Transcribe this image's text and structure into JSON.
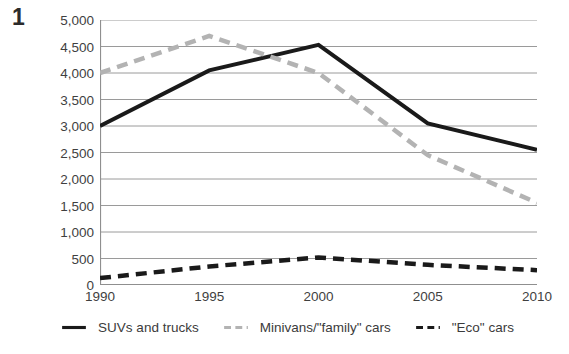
{
  "figure": {
    "number": "1"
  },
  "chart_data": {
    "type": "line",
    "title": "",
    "subtitle": "",
    "xlabel": "",
    "ylabel": "",
    "categories": [
      "1990",
      "1995",
      "2000",
      "2005",
      "2010"
    ],
    "x": [
      1990,
      1995,
      2000,
      2005,
      2010
    ],
    "xlim": [
      1990,
      2010
    ],
    "ylim": [
      0,
      5000
    ],
    "y_ticks": [
      0,
      500,
      1000,
      1500,
      2000,
      2500,
      3000,
      3500,
      4000,
      4500,
      5000
    ],
    "y_tick_labels": [
      "0",
      "500",
      "1,000",
      "1,500",
      "2,000",
      "2,500",
      "3,000",
      "3,500",
      "4,000",
      "4,500",
      "5,000"
    ],
    "x_tick_labels": [
      "1990",
      "1995",
      "2000",
      "2005",
      "2010"
    ],
    "grid": true,
    "grid_axis": "y",
    "legend_position": "bottom",
    "series": [
      {
        "name": "SUVs and trucks",
        "values": [
          3000,
          4050,
          4530,
          3050,
          2550
        ],
        "color": "#1a1a1a",
        "style": "solid",
        "width": 4
      },
      {
        "name": "Minivans/\"family\" cars",
        "values": [
          4000,
          4700,
          4000,
          2450,
          1550
        ],
        "color": "#b3b3b3",
        "style": "dashed",
        "width": 4.5
      },
      {
        "name": "\"Eco\" cars",
        "values": [
          130,
          350,
          520,
          380,
          280
        ],
        "color": "#1a1a1a",
        "style": "dashed",
        "width": 4.5
      }
    ]
  },
  "legend": {
    "items": [
      {
        "label": "SUVs and trucks",
        "color": "#1a1a1a",
        "style": "solid"
      },
      {
        "label": "Minivans/\"family\" cars",
        "color": "#b3b3b3",
        "style": "dashed"
      },
      {
        "label": "\"Eco\" cars",
        "color": "#1a1a1a",
        "style": "dashed"
      }
    ]
  },
  "colors": {
    "grid": "#9a9a9a",
    "axis": "#8f8f8f",
    "text": "#3b3b3b",
    "background": "#ffffff"
  }
}
